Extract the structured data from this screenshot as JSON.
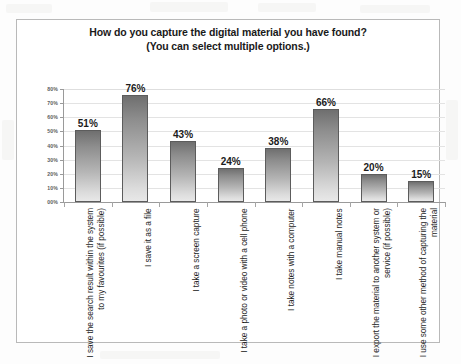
{
  "chart_data": {
    "type": "bar",
    "title": "How do you capture the digital material you have found?",
    "subtitle": "(You can select multiple options.)",
    "xlabel": "",
    "ylabel": "",
    "ylim": [
      0,
      80
    ],
    "ytick_labels": [
      "80%",
      "70%",
      "60%",
      "50%",
      "40%",
      "30%",
      "20%",
      "10%",
      "00%"
    ],
    "ytick_values": [
      80,
      70,
      60,
      50,
      40,
      30,
      20,
      10,
      0
    ],
    "grid": true,
    "legend": "none",
    "orientation": "vertical",
    "categories": [
      "I save the search result within the system to my favourites (if possible)",
      "I save it as a file",
      "I take a screen capture",
      "I take a photo or video with a cell phone",
      "I take notes with a computer",
      "I take manual notes",
      "I export the material to another system or service (if possible)",
      "I use some other method of capturing the material"
    ],
    "values": [
      51,
      76,
      43,
      24,
      38,
      66,
      20,
      15
    ],
    "data_labels": [
      "51%",
      "76%",
      "43%",
      "24%",
      "38%",
      "66%",
      "20%",
      "15%"
    ],
    "bar_color_top": "#6f6f6f",
    "bar_color_bottom": "#e8e8e8",
    "bar_border_color": "#5c5c5c",
    "gridline_color": "#e3e3e3",
    "axis_color": "#9a9a9a",
    "frame_border_color": "#b9b9b9",
    "background_color": "#ffffff"
  }
}
